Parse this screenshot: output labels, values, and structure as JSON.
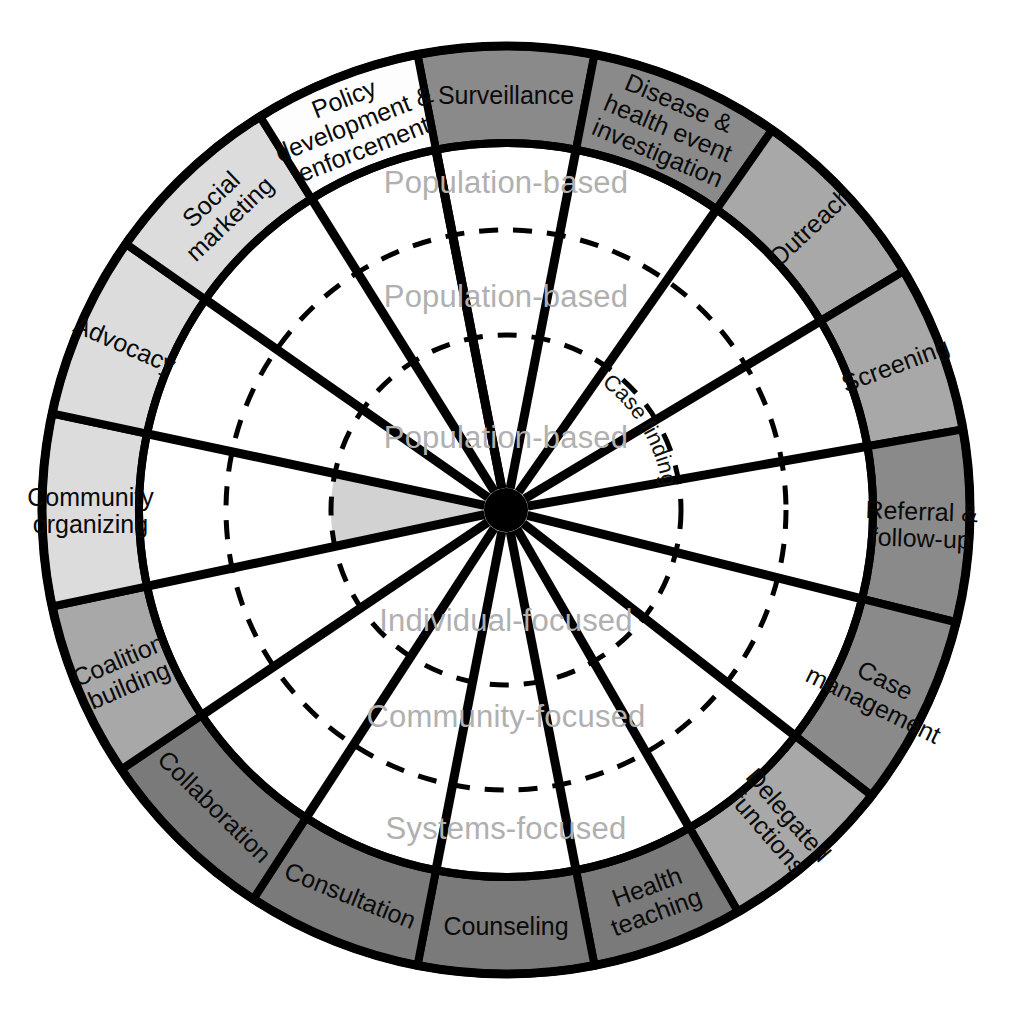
{
  "diagram": {
    "center": {
      "x": 506,
      "y": 510
    },
    "radii": {
      "outer": 464,
      "ring_inner": 367,
      "dashed_outer": 280,
      "dashed_inner": 175,
      "hub": 22
    },
    "colors": {
      "stroke": "#000000",
      "white": "#fdfdfd",
      "light_gray": "#dcdcdc",
      "mid_gray": "#a8a8a8",
      "dark_gray": "#8a8a8a",
      "darker_gray": "#7a7a7a",
      "ring_label": "#b0b0b0",
      "hub": "#000000",
      "wedge_fill": "#d2d2d2",
      "background": "#ffffff"
    },
    "outer_ring": {
      "name": "intervention-segments",
      "segment_count": 17,
      "segments": [
        {
          "label": "Surveillance",
          "lines": [
            "Surveillance"
          ],
          "shade": "dark_gray",
          "start_deg": -101.0,
          "end_deg": -79.0,
          "text_mode": "tangential"
        },
        {
          "label": "Disease & health event investigation",
          "lines": [
            "Disease &",
            "health event",
            "investigation"
          ],
          "shade": "dark_gray",
          "start_deg": -79.0,
          "end_deg": -55.0,
          "text_mode": "tangential"
        },
        {
          "label": "Outreach",
          "lines": [
            "Outreach"
          ],
          "shade": "mid_gray",
          "start_deg": -55.0,
          "end_deg": -31.0,
          "text_mode": "radial"
        },
        {
          "label": "Screening",
          "lines": [
            "Screening"
          ],
          "shade": "mid_gray",
          "start_deg": -31.0,
          "end_deg": -10.0,
          "text_mode": "radial"
        },
        {
          "label": "Referral & follow-up",
          "lines": [
            "Referral &",
            "follow-up"
          ],
          "shade": "dark_gray",
          "start_deg": -10.0,
          "end_deg": 14.0,
          "text_mode": "radial"
        },
        {
          "label": "Case management",
          "lines": [
            "Case",
            "management"
          ],
          "shade": "dark_gray",
          "start_deg": 14.0,
          "end_deg": 38.0,
          "text_mode": "radial"
        },
        {
          "label": "Delegated functions",
          "lines": [
            "Delegated",
            "functions"
          ],
          "shade": "mid_gray",
          "start_deg": 38.0,
          "end_deg": 60.0,
          "text_mode": "radial"
        },
        {
          "label": "Health teaching",
          "lines": [
            "Health",
            "teaching"
          ],
          "shade": "darker_gray",
          "start_deg": 60.0,
          "end_deg": 79.0,
          "text_mode": "tangential"
        },
        {
          "label": "Counseling",
          "lines": [
            "Counseling"
          ],
          "shade": "darker_gray",
          "start_deg": 79.0,
          "end_deg": 101.0,
          "text_mode": "tangential"
        },
        {
          "label": "Consultation",
          "lines": [
            "Consultation"
          ],
          "shade": "darker_gray",
          "start_deg": 101.0,
          "end_deg": 123.0,
          "text_mode": "tangential"
        },
        {
          "label": "Collaboration",
          "lines": [
            "Collaboration"
          ],
          "shade": "darker_gray",
          "start_deg": 123.0,
          "end_deg": 146.0,
          "text_mode": "tangential"
        },
        {
          "label": "Coalition building",
          "lines": [
            "Coalition",
            "building"
          ],
          "shade": "mid_gray",
          "start_deg": 146.0,
          "end_deg": 168.0,
          "text_mode": "radial"
        },
        {
          "label": "Community organizing",
          "lines": [
            "Community",
            "organizing"
          ],
          "shade": "light_gray",
          "start_deg": 168.0,
          "end_deg": 192.0,
          "text_mode": "radial"
        },
        {
          "label": "Advocacy",
          "lines": [
            "Advocacy"
          ],
          "shade": "light_gray",
          "start_deg": 192.0,
          "end_deg": 215.0,
          "text_mode": "radial"
        },
        {
          "label": "Social marketing",
          "lines": [
            "Social",
            "marketing"
          ],
          "shade": "light_gray",
          "start_deg": 215.0,
          "end_deg": 238.0,
          "text_mode": "tangential"
        },
        {
          "label": "Policy development & enforcement",
          "lines": [
            "Policy",
            "development &",
            "enforcement"
          ],
          "shade": "white",
          "start_deg": 238.0,
          "end_deg": 259.0,
          "text_mode": "tangential"
        },
        {
          "label": "spacer-segment",
          "lines": [],
          "shade": "white",
          "start_deg": 259.0,
          "end_deg": 259.0,
          "text_mode": "tangential"
        }
      ]
    },
    "inner_rings": [
      {
        "label": "Population-based",
        "name": "ring-label-population-based-outer",
        "x": 506,
        "y": 182,
        "anchor": "middle"
      },
      {
        "label": "Population-based",
        "name": "ring-label-population-based-middle",
        "x": 506,
        "y": 296,
        "anchor": "middle"
      },
      {
        "label": "Population-based",
        "name": "ring-label-population-based-inner",
        "x": 506,
        "y": 437,
        "anchor": "middle"
      },
      {
        "label": "Individual-focused",
        "name": "ring-label-individual-focused",
        "x": 506,
        "y": 620,
        "anchor": "middle"
      },
      {
        "label": "Community-focused",
        "name": "ring-label-community-focused",
        "x": 506,
        "y": 716,
        "anchor": "middle"
      },
      {
        "label": "Systems-focused",
        "name": "ring-label-systems-focused",
        "x": 506,
        "y": 828,
        "anchor": "middle"
      }
    ],
    "arc_labels": [
      {
        "label": "Case finding",
        "name": "arc-label-case-finding",
        "radius": 158,
        "start_deg": -66,
        "sweep": 1
      }
    ],
    "spokes": {
      "name": "radial-spokes",
      "angles_deg": [
        -101,
        -79,
        -55,
        -31,
        -10,
        14,
        38,
        60,
        79,
        101,
        123,
        146,
        168,
        192,
        215,
        238,
        259
      ],
      "inner_radius": 22
    },
    "highlight_wedge": {
      "name": "highlight-wedge-community-organizing",
      "start_deg": 168,
      "end_deg": 192,
      "radius": 175
    }
  }
}
